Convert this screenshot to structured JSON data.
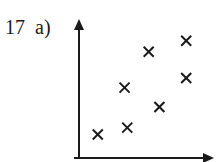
{
  "question_label": "17  a)",
  "chart_data": {
    "type": "scatter",
    "title": "",
    "xlabel": "",
    "ylabel": "",
    "grid": false,
    "ticks": false,
    "marker": "x",
    "xlim": [
      0,
      10
    ],
    "ylim": [
      0,
      10
    ],
    "points": [
      {
        "x": 1.4,
        "y": 1.7
      },
      {
        "x": 3.6,
        "y": 2.2
      },
      {
        "x": 3.4,
        "y": 5.1
      },
      {
        "x": 5.2,
        "y": 7.7
      },
      {
        "x": 6.0,
        "y": 3.7
      },
      {
        "x": 8.0,
        "y": 8.5
      },
      {
        "x": 8.0,
        "y": 5.8
      }
    ]
  },
  "colors": {
    "ink": "#1a1a1a",
    "background": "#ffffff"
  }
}
